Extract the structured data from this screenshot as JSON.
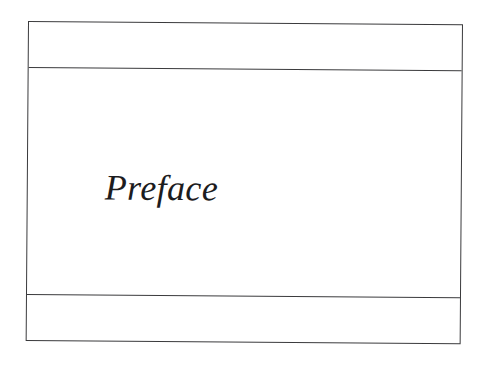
{
  "page": {
    "kind": "scanned-book-page",
    "background_color": "#ffffff",
    "rule_color": "#3a3a3c",
    "text_color": "#1c1c1e"
  },
  "frame": {
    "name": "ruled-title-frame",
    "bands": [
      {
        "id": "header",
        "label": "",
        "content": ""
      },
      {
        "id": "body",
        "label": "",
        "content": "Preface"
      },
      {
        "id": "footer",
        "label": "",
        "content": ""
      }
    ],
    "rules": [
      {
        "id": "rule-top"
      },
      {
        "id": "rule-bottom"
      }
    ]
  },
  "chapter": {
    "title": "Preface"
  }
}
